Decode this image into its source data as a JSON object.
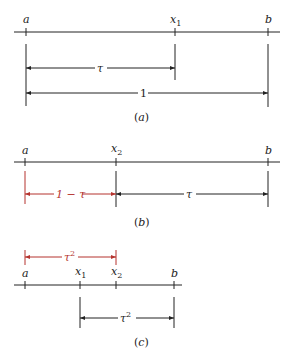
{
  "colors": {
    "ink": "#222222",
    "accent": "#b5332e"
  },
  "panel_a": {
    "points": {
      "a": "a",
      "x1": "x",
      "x1_sub": "1",
      "b": "b"
    },
    "arrows": {
      "tau": "τ",
      "one": "1"
    },
    "caption": "(a)"
  },
  "panel_b": {
    "points": {
      "a": "a",
      "x2": "x",
      "x2_sub": "2",
      "b": "b"
    },
    "arrows": {
      "one_minus_tau": "1 − τ",
      "tau": "τ"
    },
    "caption": "(b)"
  },
  "panel_c": {
    "points": {
      "a": "a",
      "x1": "x",
      "x1_sub": "1",
      "x2": "x",
      "x2_sub": "2",
      "b": "b"
    },
    "arrows": {
      "tau_sq_top": "τ",
      "tau_sq_top_sup": "2",
      "tau_sq_bottom": "τ",
      "tau_sq_bottom_sup": "2"
    },
    "caption": "(c)"
  }
}
